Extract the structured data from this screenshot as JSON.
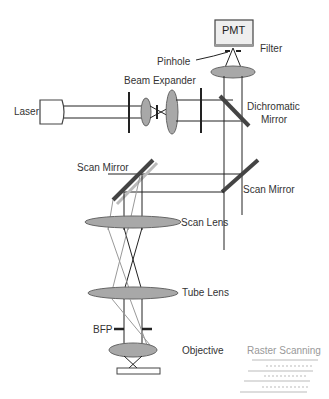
{
  "diagram": {
    "labels": {
      "pmt": "PMT",
      "filter": "Filter",
      "pinhole": "Pinhole",
      "beam_expander": "Beam Expander",
      "laser": "Laser",
      "dichromatic_mirror_1": "Dichromatic",
      "dichromatic_mirror_2": "Mirror",
      "scan_mirror_left": "Scan Mirror",
      "scan_mirror_right": "Scan Mirror",
      "scan_lens": "Scan Lens",
      "tube_lens": "Tube Lens",
      "bfp": "BFP",
      "objective": "Objective",
      "raster_scanning": "Raster Scanning"
    },
    "colors": {
      "line": "#222222",
      "lens_fill": "#a8a8a8",
      "ghost": "#999999",
      "raster": "#aaaaaa"
    }
  }
}
